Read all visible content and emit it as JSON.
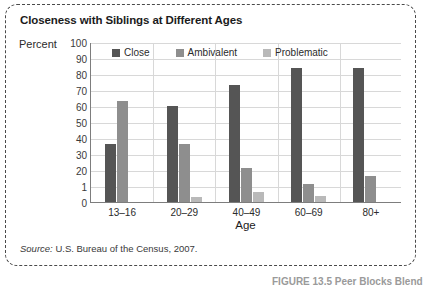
{
  "figure": {
    "title": "Closeness with Siblings at Different Ages",
    "source_prefix": "Source:",
    "source_text": " U.S. Bureau of the Census, 2007.",
    "caption": "FIGURE 13.5  Peer Blocks Blend"
  },
  "chart_data": {
    "type": "bar",
    "title": "Closeness with Siblings at Different Ages",
    "xlabel": "Age",
    "ylabel": "Percent",
    "categories": [
      "13–16",
      "20–29",
      "40–49",
      "60–69",
      "80+"
    ],
    "series": [
      {
        "name": "Close",
        "color": "#555555",
        "values": [
          36,
          60,
          73,
          84,
          84
        ]
      },
      {
        "name": "Ambivalent",
        "color": "#8e8e8e",
        "values": [
          63,
          36,
          21,
          11,
          16
        ]
      },
      {
        "name": "Problematic",
        "color": "#b9b9b9",
        "values": [
          0,
          3,
          6,
          4,
          0
        ]
      }
    ],
    "ylim": [
      0,
      100
    ],
    "yticks": [
      "0",
      "1",
      "20",
      "30",
      "40",
      "50",
      "60",
      "70",
      "80",
      "90",
      "100"
    ],
    "ytick_values": [
      0,
      10,
      20,
      30,
      40,
      50,
      60,
      70,
      80,
      90,
      100
    ],
    "grid": true,
    "legend_position": "top-inside"
  }
}
